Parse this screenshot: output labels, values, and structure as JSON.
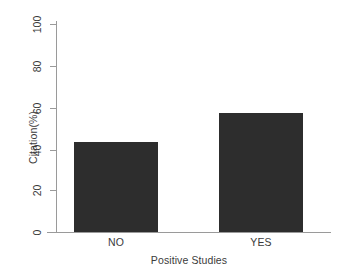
{
  "chart_data": {
    "type": "bar",
    "title": "",
    "subtitle": "",
    "xlabel": "Positive Studies",
    "ylabel": "Citation(%)",
    "categories": [
      "NO",
      "YES"
    ],
    "values": [
      43,
      57
    ],
    "series": [
      {
        "name": "Citation(%)",
        "values": [
          43,
          57
        ]
      }
    ],
    "ylim": [
      0,
      100
    ],
    "yticks": [
      "0",
      "20",
      "40",
      "60",
      "80",
      "100"
    ],
    "ytick_values": [
      0,
      20,
      40,
      60,
      80,
      100
    ],
    "grid": false,
    "legend": false,
    "legend_position": "none",
    "bar_color": "#2d2d2d",
    "axis_color": "#9a9a9a",
    "text_color": "#3b3b3b",
    "background_color": "#ffffff",
    "annotations": []
  }
}
